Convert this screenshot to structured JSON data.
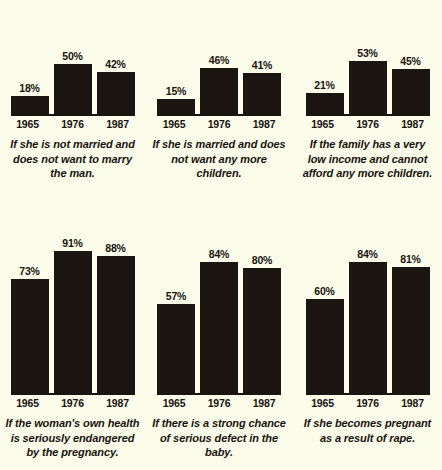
{
  "chart_data": {
    "type": "bar",
    "title": "",
    "subtitle": "",
    "xlabel": "",
    "ylabel": "",
    "ylim": [
      0,
      100
    ],
    "grid": false,
    "legend_position": "none",
    "categories": [
      "1965",
      "1976",
      "1987"
    ],
    "value_suffix": "%",
    "panels": [
      {
        "id": "panel-not-married",
        "caption": "If she is not married and does not want to marry the man.",
        "categories": [
          "1965",
          "1976",
          "1987"
        ],
        "values": [
          18,
          50,
          42
        ],
        "labels": [
          "18%",
          "50%",
          "42%"
        ]
      },
      {
        "id": "panel-married-no-more-children",
        "caption": "If she is married and does not want any more children.",
        "categories": [
          "1965",
          "1976",
          "1987"
        ],
        "values": [
          15,
          46,
          41
        ],
        "labels": [
          "15%",
          "46%",
          "41%"
        ]
      },
      {
        "id": "panel-low-income",
        "caption": "If the family has a very low income and cannot afford any more children.",
        "categories": [
          "1965",
          "1976",
          "1987"
        ],
        "values": [
          21,
          53,
          45
        ],
        "labels": [
          "21%",
          "53%",
          "45%"
        ]
      },
      {
        "id": "panel-health-endangered",
        "caption": "If the woman's own health is seriously endangered by the pregnancy.",
        "categories": [
          "1965",
          "1976",
          "1987"
        ],
        "values": [
          73,
          91,
          88
        ],
        "labels": [
          "73%",
          "91%",
          "88%"
        ]
      },
      {
        "id": "panel-serious-defect",
        "caption": "If there is a strong chance of serious defect in the baby.",
        "categories": [
          "1965",
          "1976",
          "1987"
        ],
        "values": [
          57,
          84,
          80
        ],
        "labels": [
          "57%",
          "84%",
          "80%"
        ]
      },
      {
        "id": "panel-rape",
        "caption": "If she becomes pregnant as a result of rape.",
        "categories": [
          "1965",
          "1976",
          "1987"
        ],
        "values": [
          60,
          84,
          81
        ],
        "labels": [
          "60%",
          "84%",
          "81%"
        ]
      }
    ]
  },
  "colors": {
    "background": "#fcfcea",
    "bar": "#1b1511",
    "text": "#19130f"
  }
}
